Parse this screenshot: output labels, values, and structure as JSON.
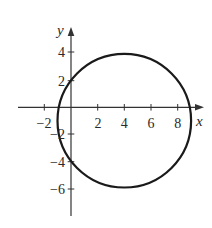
{
  "figure": {
    "type": "circle-on-coordinate-plane",
    "axis_labels": {
      "x": "x",
      "y": "y"
    },
    "x_ticks": [
      {
        "value": -2,
        "label": "−2"
      },
      {
        "value": 2,
        "label": "2"
      },
      {
        "value": 4,
        "label": "4"
      },
      {
        "value": 6,
        "label": "6"
      },
      {
        "value": 8,
        "label": "8"
      }
    ],
    "y_ticks": [
      {
        "value": 4,
        "label": "4"
      },
      {
        "value": 2,
        "label": "2"
      },
      {
        "value": -2,
        "label": "−2"
      },
      {
        "value": -4,
        "label": "−4"
      },
      {
        "value": -6,
        "label": "−6"
      }
    ],
    "circle": {
      "center": [
        4,
        -1
      ],
      "radius": 5
    },
    "colors": {
      "stroke": "#1a1a1a",
      "axis": "#333333",
      "background": "#ffffff"
    }
  }
}
